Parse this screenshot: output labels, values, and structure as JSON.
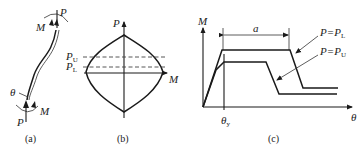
{
  "figure": {
    "panels": [
      {
        "id": "a",
        "caption": "(a)",
        "description": "Beam-column member under axial load P and end moment M, with rotation θ",
        "labels": {
          "top_load": "P",
          "top_moment": "M",
          "bottom_load": "P",
          "bottom_moment": "M",
          "rotation": "θ"
        }
      },
      {
        "id": "b",
        "caption": "(b)",
        "description": "P-M interaction diagram (lens-shaped yield surface)",
        "labels": {
          "y_axis": "P",
          "x_axis": "M",
          "upper_load": "P",
          "upper_load_sub": "U",
          "lower_load": "P",
          "lower_load_sub": "L"
        }
      },
      {
        "id": "c",
        "caption": "(c)",
        "description": "Moment-rotation curves for two axial load levels",
        "labels": {
          "y_axis": "M",
          "x_axis": "θ",
          "yield_rotation": "θ",
          "yield_rotation_sub": "y",
          "plateau_length": "a",
          "curve1_label": "P=P",
          "curve1_sub": "L",
          "curve2_label": "P=P",
          "curve2_sub": "U"
        }
      }
    ]
  }
}
